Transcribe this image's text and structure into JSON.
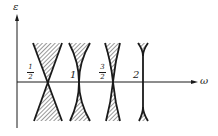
{
  "diagram": {
    "type": "instability-tongues",
    "axes": {
      "y_label": "ε",
      "x_label": "ω"
    },
    "tongues": [
      {
        "label_num": "1",
        "label_den": "2",
        "label": "1/2",
        "value": 0.5,
        "shape": "wide"
      },
      {
        "label": "1",
        "value": 1,
        "shape": "medium"
      },
      {
        "label_num": "3",
        "label_den": "2",
        "label": "3/2",
        "value": 1.5,
        "shape": "narrow"
      },
      {
        "label": "2",
        "value": 2,
        "shape": "very-narrow"
      }
    ],
    "colors": {
      "ink": "#1a1a1a",
      "background": "#ffffff"
    }
  }
}
